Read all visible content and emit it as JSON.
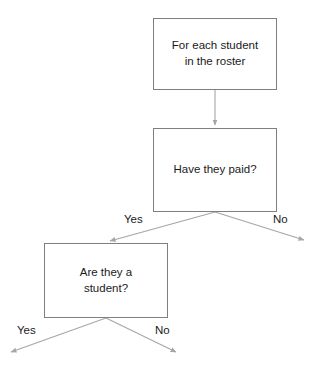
{
  "diagram": {
    "background_color": "#ffffff",
    "node_border_color": "#7f7f7f",
    "edge_color": "#a6a6a6",
    "text_color": "#1a1a1a",
    "nodes": [
      {
        "id": "start",
        "shape": "rectangle",
        "text": "For each student\nin the roster"
      },
      {
        "id": "paid",
        "shape": "rectangle",
        "text": "Have they paid?"
      },
      {
        "id": "student",
        "shape": "rectangle",
        "text": "Are they a\nstudent?"
      }
    ],
    "edges": [
      {
        "id": "start-to-paid",
        "from": "start",
        "to": "paid",
        "label": ""
      },
      {
        "id": "paid-yes",
        "from": "paid",
        "to": "student",
        "label": "Yes"
      },
      {
        "id": "paid-no",
        "from": "paid",
        "to": "",
        "label": "No"
      },
      {
        "id": "student-yes",
        "from": "student",
        "to": "",
        "label": "Yes"
      },
      {
        "id": "student-no",
        "from": "student",
        "to": "",
        "label": "No"
      }
    ]
  }
}
